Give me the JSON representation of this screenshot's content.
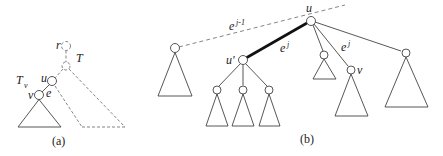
{
  "panel_a": {
    "caption": "(a)",
    "labels": {
      "r": "r",
      "T": "T",
      "u": "u",
      "v": "v",
      "e": "e",
      "Tv": "T",
      "Tv_sub": "v"
    }
  },
  "panel_b": {
    "caption": "(b)",
    "labels": {
      "u": "u",
      "u_prime": "u'",
      "v": "v",
      "e_prev": "e",
      "e_prev_sup": "j-1",
      "e_cur": "e",
      "e_cur_sup": "j",
      "e_next": "e",
      "e_next_sup": "j"
    }
  },
  "colors": {
    "stroke": "#444444",
    "thick": "#111111",
    "dashed": "#777777"
  }
}
